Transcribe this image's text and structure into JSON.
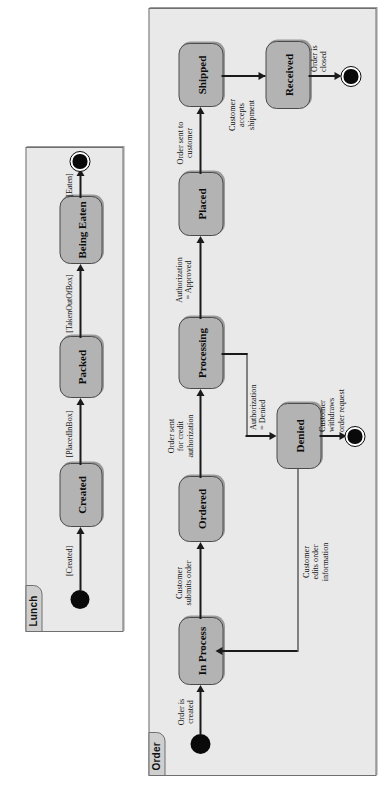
{
  "page": {
    "background_color": "#ffffff",
    "orientation": "rotated-90-ccw"
  },
  "colors": {
    "panel_fill": "#e9e9e9",
    "panel_border": "#6f6f6f",
    "tab_fill": "#cfcfcf",
    "state_fill": "#b3b3b3",
    "state_border": "#4a4a4a",
    "node_fill": "#0a0a0a",
    "line": "#1a1a1a",
    "text": "#111111"
  },
  "diagrams": [
    {
      "name": "Lunch",
      "tab_label": "Lunch",
      "nodes": [
        {
          "id": "start",
          "type": "initial-node",
          "label": ""
        },
        {
          "id": "created",
          "type": "state",
          "label": "Created"
        },
        {
          "id": "packed",
          "type": "state",
          "label": "Packed"
        },
        {
          "id": "being_eaten",
          "type": "state",
          "label": "Being Eaten"
        },
        {
          "id": "end",
          "type": "final-node",
          "label": ""
        }
      ],
      "transitions": [
        {
          "id": "t1",
          "from": "start",
          "to": "created",
          "label": "[Created]"
        },
        {
          "id": "t2",
          "from": "created",
          "to": "packed",
          "label": "[PlacedInBox]"
        },
        {
          "id": "t3",
          "from": "packed",
          "to": "being_eaten",
          "label": "[TakenOutOfBox]"
        },
        {
          "id": "t4",
          "from": "being_eaten",
          "to": "end",
          "label": "[Eaten]"
        }
      ]
    },
    {
      "name": "Order",
      "tab_label": "Order",
      "nodes": [
        {
          "id": "start",
          "type": "initial-node",
          "label": ""
        },
        {
          "id": "in_process",
          "type": "state",
          "label": "In Process"
        },
        {
          "id": "ordered",
          "type": "state",
          "label": "Ordered"
        },
        {
          "id": "processing",
          "type": "state",
          "label": "Processing"
        },
        {
          "id": "placed",
          "type": "state",
          "label": "Placed"
        },
        {
          "id": "shipped",
          "type": "state",
          "label": "Shipped"
        },
        {
          "id": "received",
          "type": "state",
          "label": "Received"
        },
        {
          "id": "denied",
          "type": "state",
          "label": "Denied"
        },
        {
          "id": "end_received",
          "type": "final-node",
          "label": ""
        },
        {
          "id": "end_denied",
          "type": "final-node",
          "label": ""
        }
      ],
      "transitions": [
        {
          "id": "o1",
          "from": "start",
          "to": "in_process",
          "label": "Order is\ncreated"
        },
        {
          "id": "o2",
          "from": "in_process",
          "to": "ordered",
          "label": "Customer\nsubmits order"
        },
        {
          "id": "o3",
          "from": "ordered",
          "to": "processing",
          "label": "Order sent\nfor credit\nauthorization"
        },
        {
          "id": "o4",
          "from": "processing",
          "to": "placed",
          "label": "Authorization\n= Approved"
        },
        {
          "id": "o5",
          "from": "placed",
          "to": "shipped",
          "label": "Order sent to\ncustomer"
        },
        {
          "id": "o6",
          "from": "shipped",
          "to": "received",
          "label": "Customer\naccepts\nshipment"
        },
        {
          "id": "o7",
          "from": "received",
          "to": "end_received",
          "label": "Order is\nclosed"
        },
        {
          "id": "o8",
          "from": "processing",
          "to": "denied",
          "label": "Authorization\n= Denied"
        },
        {
          "id": "o9",
          "from": "denied",
          "to": "end_denied",
          "label": "Customer\nwithdraws\norder request"
        },
        {
          "id": "o10",
          "from": "denied",
          "to": "in_process",
          "label": "Customer\nedits order\ninformation"
        }
      ]
    }
  ]
}
